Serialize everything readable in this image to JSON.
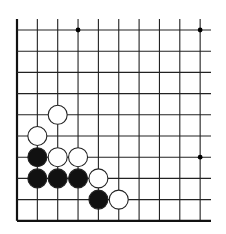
{
  "board": {
    "description": "Go board corner diagram (lower-left corner, 10x10 visible section)",
    "columns": 10,
    "rows": 10,
    "origin_x": 17,
    "origin_y": 30,
    "spacing_x": 20.35,
    "spacing_y": 21.2,
    "top_extent": 19,
    "right_extent": 211,
    "line_color": "#222222",
    "edge_color": "#111111",
    "edges": [
      "left",
      "bottom"
    ],
    "star_points": [
      {
        "col": 3,
        "row": 0
      },
      {
        "col": 9,
        "row": 0
      },
      {
        "col": 9,
        "row": 6
      }
    ],
    "stones": [
      {
        "color": "white",
        "col": 2,
        "row": 4
      },
      {
        "color": "white",
        "col": 1,
        "row": 5
      },
      {
        "color": "black",
        "col": 1,
        "row": 6
      },
      {
        "color": "white",
        "col": 2,
        "row": 6
      },
      {
        "color": "white",
        "col": 3,
        "row": 6
      },
      {
        "color": "black",
        "col": 1,
        "row": 7
      },
      {
        "color": "black",
        "col": 2,
        "row": 7
      },
      {
        "color": "black",
        "col": 3,
        "row": 7
      },
      {
        "color": "white",
        "col": 4,
        "row": 7
      },
      {
        "color": "black",
        "col": 4,
        "row": 8
      },
      {
        "color": "white",
        "col": 5,
        "row": 8
      }
    ],
    "stone_radius": 9.5,
    "black_fill": "#111111",
    "white_fill": "#ffffff",
    "stone_stroke": "#222222"
  }
}
